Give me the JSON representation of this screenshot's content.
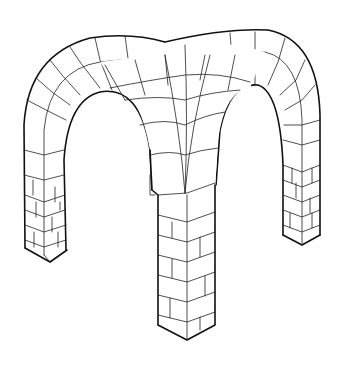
{
  "figure": {
    "subject": "Groin vault line drawing",
    "colors": {
      "background": "#ffffff",
      "stroke": "#111111"
    }
  }
}
